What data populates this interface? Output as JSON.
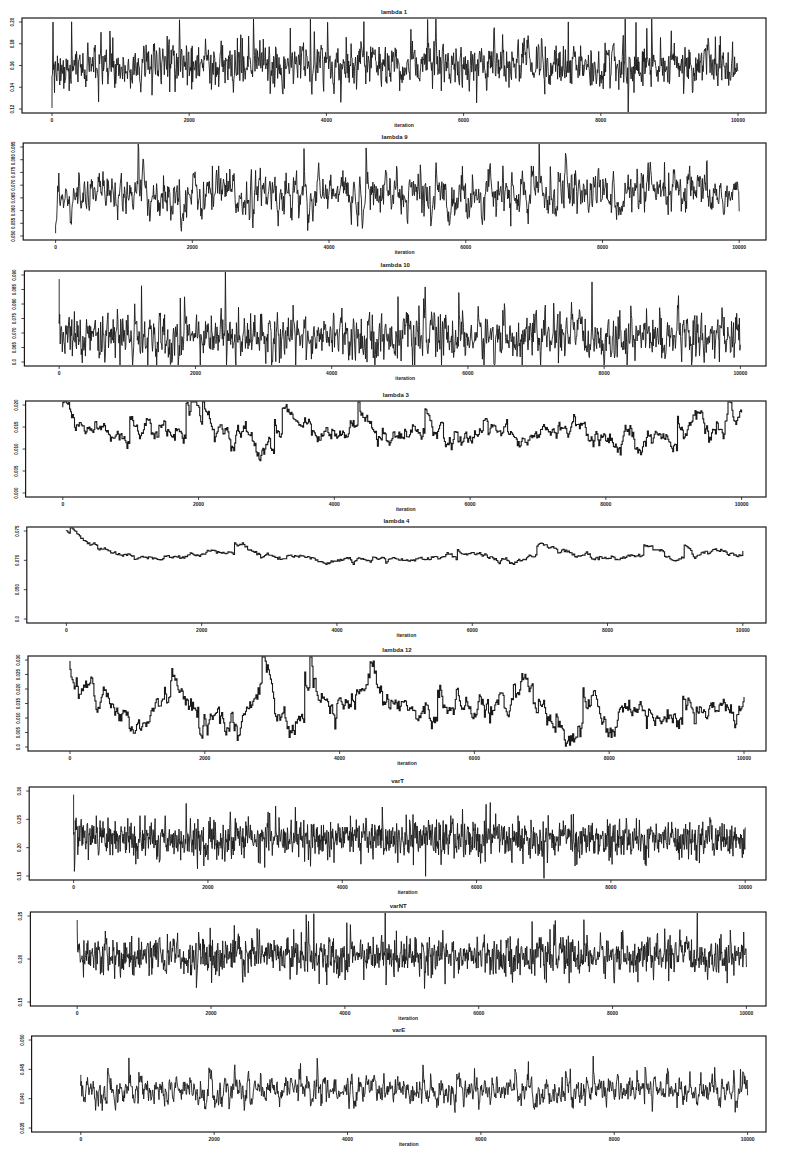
{
  "figure": {
    "width": 786,
    "height": 1151,
    "panel_count": 9,
    "ink_color": "#1a1a1a",
    "background": "#ffffff"
  },
  "chart_data": [
    {
      "type": "line",
      "title": "lambda 1",
      "xlabel": "iteration",
      "ylabel": "",
      "xlim": [
        0,
        10000
      ],
      "xticks": [
        0,
        2000,
        4000,
        6000,
        8000,
        10000
      ],
      "yticks": [
        "0.12",
        "0.14",
        "0.16",
        "0.18",
        "0.20"
      ],
      "ylim": [
        0.115,
        0.205
      ],
      "series": [
        {
          "name": "lambda 1",
          "mean": 0.16,
          "sd": 0.012,
          "ar": 0.3,
          "steps": 1400,
          "seed": 11,
          "start": 0.118
        }
      ],
      "frame": {
        "top": 18,
        "bottom": 113
      }
    },
    {
      "type": "line",
      "title": "lambda 9",
      "xlabel": "iteration",
      "ylabel": "",
      "xlim": [
        0,
        10000
      ],
      "xticks": [
        0,
        2000,
        4000,
        6000,
        8000,
        10000
      ],
      "yticks": [
        "0.050",
        "0.055",
        "0.060",
        "0.065",
        "0.070",
        "0.075",
        "0.080",
        "0.085"
      ],
      "ylim": [
        0.048,
        0.087
      ],
      "series": [
        {
          "name": "lambda 9",
          "mean": 0.066,
          "sd": 0.005,
          "ar": 0.55,
          "steps": 1300,
          "seed": 23,
          "start": 0.05
        }
      ],
      "frame": {
        "top": 143,
        "bottom": 240
      }
    },
    {
      "type": "line",
      "title": "lambda 10",
      "xlabel": "iteration",
      "ylabel": "",
      "xlim": [
        0,
        10000
      ],
      "xticks": [
        0,
        2000,
        4000,
        6000,
        8000,
        10000
      ],
      "yticks": [
        "0.0",
        "0.065",
        "0.070",
        "0.075",
        "0.080",
        "0.085",
        "0.090"
      ],
      "ylim": [
        0.062,
        0.092
      ],
      "series": [
        {
          "name": "lambda 10",
          "mean": 0.071,
          "sd": 0.004,
          "ar": 0.35,
          "steps": 1300,
          "seed": 37,
          "start": 0.09
        }
      ],
      "frame": {
        "top": 271,
        "bottom": 366
      }
    },
    {
      "type": "line",
      "title": "lambda 3",
      "xlabel": "iteration",
      "ylabel": "",
      "xlim": [
        0,
        10000
      ],
      "xticks": [
        0,
        2000,
        4000,
        6000,
        8000,
        10000
      ],
      "yticks": [
        "0.000",
        "0.005",
        "0.010",
        "0.015",
        "0.020"
      ],
      "ylim": [
        -0.001,
        0.021
      ],
      "series": [
        {
          "name": "lambda 3",
          "mean": 0.0135,
          "sd": 0.0022,
          "ar": 0.9,
          "steps": 700,
          "seed": 51,
          "start": 0.02
        }
      ],
      "frame": {
        "top": 401,
        "bottom": 497
      }
    },
    {
      "type": "line",
      "title": "lambda 4",
      "xlabel": "iteration",
      "ylabel": "",
      "xlim": [
        0,
        10000
      ],
      "xticks": [
        0,
        2000,
        4000,
        6000,
        8000,
        10000
      ],
      "yticks": [
        "0.0",
        "0.050",
        "0.070",
        "0.075"
      ],
      "ylim": [
        0.0,
        0.077
      ],
      "series": [
        {
          "name": "lambda 4",
          "mean": 0.054,
          "sd": 0.003,
          "ar": 0.93,
          "steps": 520,
          "seed": 67,
          "start": 0.076
        }
      ],
      "frame": {
        "top": 527,
        "bottom": 623
      }
    },
    {
      "type": "line",
      "title": "lambda 12",
      "xlabel": "iteration",
      "ylabel": "",
      "xlim": [
        0,
        10000
      ],
      "xticks": [
        0,
        2000,
        4000,
        6000,
        8000,
        10000
      ],
      "yticks": [
        "0.0",
        "0.005",
        "0.010",
        "0.015",
        "0.020",
        "0.025",
        "0.030"
      ],
      "ylim": [
        0.0,
        0.031
      ],
      "series": [
        {
          "name": "lambda 12",
          "mean": 0.013,
          "sd": 0.0045,
          "ar": 0.9,
          "steps": 650,
          "seed": 79,
          "start": 0.03
        }
      ],
      "frame": {
        "top": 656,
        "bottom": 751
      }
    },
    {
      "type": "line",
      "title": "varT",
      "xlabel": "iteration",
      "ylabel": "",
      "xlim": [
        0,
        10000
      ],
      "xticks": [
        0,
        2000,
        4000,
        6000,
        8000,
        10000
      ],
      "yticks": [
        "0.15",
        "0.20",
        "0.25",
        "0.30"
      ],
      "ylim": [
        0.145,
        0.305
      ],
      "series": [
        {
          "name": "varT",
          "mean": 0.215,
          "sd": 0.018,
          "ar": 0.15,
          "steps": 1600,
          "seed": 97,
          "start": 0.295
        }
      ],
      "frame": {
        "top": 787,
        "bottom": 880
      }
    },
    {
      "type": "line",
      "title": "varNT",
      "xlabel": "iteration",
      "ylabel": "",
      "xlim": [
        0,
        10000
      ],
      "xticks": [
        0,
        2000,
        4000,
        6000,
        8000,
        10000
      ],
      "yticks": [
        "0.15",
        "0.20",
        "0.25"
      ],
      "ylim": [
        0.115,
        0.265
      ],
      "series": [
        {
          "name": "varNT",
          "mean": 0.195,
          "sd": 0.016,
          "ar": 0.2,
          "steps": 1500,
          "seed": 113,
          "start": 0.255
        }
      ],
      "frame": {
        "top": 912,
        "bottom": 1006
      }
    },
    {
      "type": "line",
      "title": "varE",
      "xlabel": "iteration",
      "ylabel": "",
      "xlim": [
        0,
        10000
      ],
      "xticks": [
        0,
        2000,
        4000,
        6000,
        8000,
        10000
      ],
      "yticks": [
        "0.035",
        "0.040",
        "0.045",
        "0.050"
      ],
      "ylim": [
        0.032,
        0.052
      ],
      "series": [
        {
          "name": "varE",
          "mean": 0.0405,
          "sd": 0.0016,
          "ar": 0.55,
          "steps": 1400,
          "seed": 131,
          "start": 0.044
        }
      ],
      "frame": {
        "top": 1036,
        "bottom": 1132
      }
    }
  ]
}
